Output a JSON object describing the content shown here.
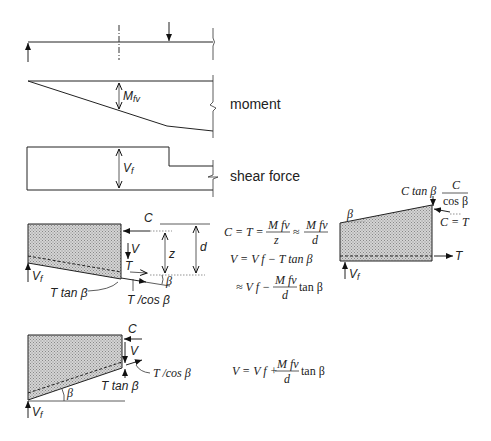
{
  "labels": {
    "moment": "moment",
    "shear_force": "shear force",
    "M_fv": "M",
    "M_fv_sub": "fv",
    "V_f": "V",
    "V_f_sub": "f",
    "C": "C",
    "V": "V",
    "T": "T",
    "z": "z",
    "d": "d",
    "beta": "β",
    "T_tan_beta": "T tan β",
    "T_cos_beta": "T /cos β",
    "C_tan_beta": "C tan β",
    "C_over": "C",
    "cos_beta": "cos β",
    "C_eq_T": "C = T"
  },
  "equations": {
    "eq1_left": "C = T =",
    "eq1_num1": "M fv",
    "eq1_den1": "z",
    "eq1_approx": "≈",
    "eq1_num2": "M fv",
    "eq1_den2": "d",
    "eq2": "V = V f − T tan β",
    "eq3_left": "≈ V f −",
    "eq3_num": "M fv",
    "eq3_den": "d",
    "eq3_right": "tan β",
    "eq4_left": "V = V f +",
    "eq4_num": "M fv",
    "eq4_den": "d",
    "eq4_right": "tan β"
  }
}
